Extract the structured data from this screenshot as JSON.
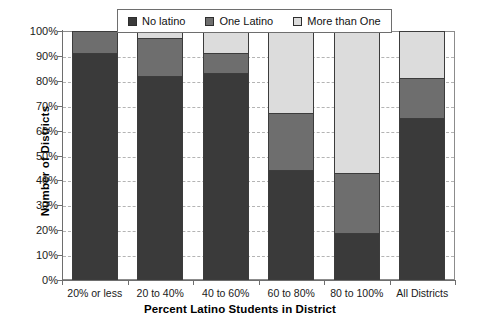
{
  "chart_data": {
    "type": "bar",
    "stacked": true,
    "title": "",
    "xlabel": "Percent Latino Students in District",
    "ylabel": "Number of Districts",
    "ylim": [
      0,
      100
    ],
    "ytick_labels": [
      "0%",
      "10%",
      "20%",
      "30%",
      "40%",
      "50%",
      "60%",
      "70%",
      "80%",
      "90%",
      "100%"
    ],
    "ytick_values": [
      0,
      10,
      20,
      30,
      40,
      50,
      60,
      70,
      80,
      90,
      100
    ],
    "grid": true,
    "grid_axis": "y",
    "legend_position": "top-center",
    "categories": [
      "20% or less",
      "20 to 40%",
      "40 to 60%",
      "60 to 80%",
      "80 to 100%",
      "All Districts"
    ],
    "series": [
      {
        "name": "No latino",
        "color": "#3a3a3a",
        "values": [
          91,
          82,
          83,
          44,
          19,
          65
        ]
      },
      {
        "name": "One Latino",
        "color": "#6e6e6e",
        "values": [
          9,
          15,
          8,
          23,
          24,
          16
        ]
      },
      {
        "name": "More than One",
        "color": "#dcdcdc",
        "values": [
          0,
          3,
          9,
          33,
          57,
          19
        ]
      }
    ]
  },
  "legend": {
    "items": [
      {
        "label": "No latino",
        "color": "#3a3a3a"
      },
      {
        "label": "One Latino",
        "color": "#6e6e6e"
      },
      {
        "label": "More than One",
        "color": "#dcdcdc"
      }
    ]
  }
}
